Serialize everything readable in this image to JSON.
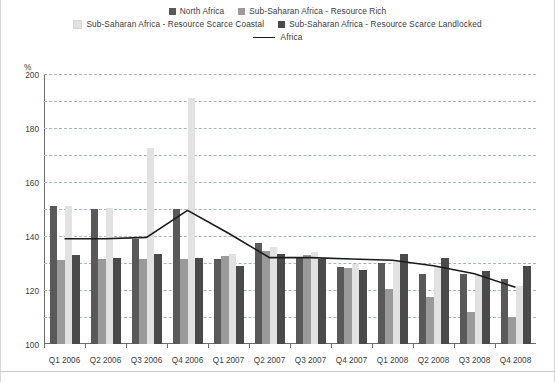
{
  "legend": {
    "rows": [
      [
        {
          "label": "North Africa",
          "marker": "square",
          "color": "#595959",
          "icon": "square-swatch-icon"
        },
        {
          "label": "Sub-Saharan Africa - Resource Rich",
          "marker": "square",
          "color": "#9a9a9a",
          "icon": "square-swatch-icon"
        }
      ],
      [
        {
          "label": "Sub-Saharan Africa - Resource Scarce Coastal",
          "marker": "square",
          "color": "#e2e2e2",
          "icon": "square-swatch-icon"
        },
        {
          "label": "Sub-Saharan Africa - Resource Scarce Landlocked",
          "marker": "square",
          "color": "#4a4a4a",
          "icon": "square-swatch-icon"
        }
      ],
      [
        {
          "label": "Africa",
          "marker": "line",
          "color": "#1a1a1a",
          "icon": "line-swatch-icon"
        }
      ]
    ]
  },
  "axis": {
    "unit_label": "%",
    "yticks": [
      "0",
      "20",
      "40",
      "60",
      "80",
      "100",
      "120",
      "140",
      "160",
      "180",
      "200"
    ]
  },
  "chart_data": {
    "type": "bar",
    "title": "",
    "subtitle": "",
    "xlabel": "",
    "ylabel": "%",
    "ylim": [
      0,
      200
    ],
    "ystep": 20,
    "grid": true,
    "legend_position": "top",
    "categories": [
      "Q1 2006",
      "Q2 2006",
      "Q3 2006",
      "Q4 2006",
      "Q1 2007",
      "Q2 2007",
      "Q3 2007",
      "Q4 2007",
      "Q1 2008",
      "Q2 2008",
      "Q3 2008",
      "Q4 2008"
    ],
    "series": [
      {
        "name": "North Africa",
        "type": "bar",
        "color": "#595959",
        "values": [
          102,
          100,
          78,
          100,
          63,
          75,
          64,
          57,
          60,
          52,
          52,
          48
        ]
      },
      {
        "name": "Sub-Saharan Africa - Resource Rich",
        "type": "bar",
        "color": "#9a9a9a",
        "values": [
          62,
          63,
          63,
          63,
          65,
          69,
          66,
          56,
          41,
          35,
          24,
          20
        ]
      },
      {
        "name": "Sub-Saharan Africa - Resource Scarce Coastal",
        "type": "bar",
        "color": "#e2e2e2",
        "values": [
          102,
          101,
          145,
          182,
          67,
          72,
          68,
          59,
          61,
          58,
          51,
          43
        ]
      },
      {
        "name": "Sub-Saharan Africa - Resource Scarce Landlocked",
        "type": "bar",
        "color": "#4a4a4a",
        "values": [
          66,
          64,
          67,
          64,
          58,
          67,
          63,
          55,
          67,
          64,
          54,
          58
        ]
      },
      {
        "name": "Africa",
        "type": "line",
        "color": "#1a1a1a",
        "values": [
          78,
          78,
          79,
          99,
          82,
          64,
          64,
          63,
          62,
          58,
          52,
          42
        ]
      }
    ]
  }
}
